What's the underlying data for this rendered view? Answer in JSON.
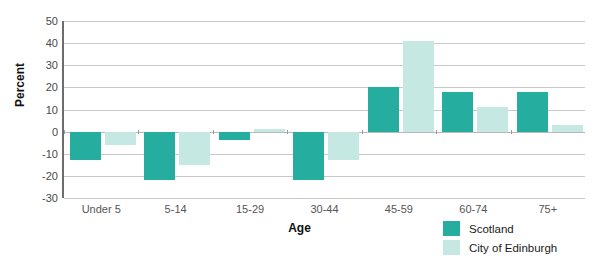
{
  "chart_data": {
    "type": "bar",
    "title": "",
    "xlabel": "Age",
    "ylabel": "Percent",
    "categories": [
      "Under 5",
      "5-14",
      "15-29",
      "30-44",
      "45-59",
      "60-74",
      "75+"
    ],
    "series": [
      {
        "name": "Scotland",
        "color": "#25ADA0",
        "values": [
          -13,
          -22,
          -4,
          -22,
          20,
          18,
          18
        ]
      },
      {
        "name": "City of Edinburgh",
        "color": "#C6E8E3",
        "values": [
          -6,
          -15,
          1,
          -13,
          41,
          11,
          3
        ]
      }
    ],
    "ylim": [
      -30,
      50
    ],
    "ytick_labels": [
      "50",
      "40",
      "30",
      "20",
      "10",
      "0",
      "-10",
      "-20",
      "-30"
    ],
    "ytick_values": [
      50,
      40,
      30,
      20,
      10,
      0,
      -10,
      -20,
      -30
    ],
    "grid": true,
    "legend_position": "bottom-right"
  },
  "legend": {
    "items": [
      {
        "label": "Scotland",
        "color": "#25ADA0"
      },
      {
        "label": "City of Edinburgh",
        "color": "#C6E8E3"
      }
    ]
  }
}
